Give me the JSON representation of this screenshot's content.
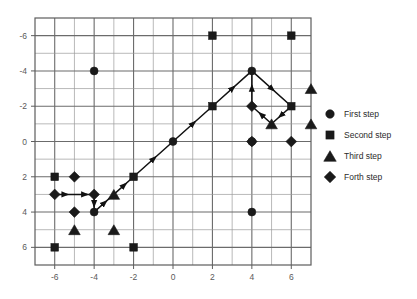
{
  "chart_data": {
    "type": "scatter",
    "title": "",
    "xlabel": "",
    "ylabel": "",
    "xlim": [
      -7,
      7
    ],
    "ylim": [
      -7,
      7
    ],
    "y_axis_inverted": true,
    "grid": true,
    "grid_step": 1,
    "xticks": [
      -6,
      -4,
      -2,
      0,
      2,
      4,
      6
    ],
    "xtick_labels": [
      "-6",
      "-4",
      "-2",
      "0",
      "2",
      "4",
      "6"
    ],
    "yticks": [
      -6,
      -4,
      -2,
      0,
      2,
      4,
      6
    ],
    "ytick_labels": [
      "-6",
      "-4",
      "-2",
      "0",
      "2",
      "4",
      "6"
    ],
    "legend_position": "right",
    "legend": [
      {
        "label": "First step",
        "marker": "circle"
      },
      {
        "label": "Second step",
        "marker": "square"
      },
      {
        "label": "Third step",
        "marker": "triangle"
      },
      {
        "label": "Forth step",
        "marker": "diamond"
      }
    ],
    "series": [
      {
        "name": "First step",
        "marker": "circle",
        "points": [
          {
            "x": -4,
            "y": -4
          },
          {
            "x": 4,
            "y": -4
          },
          {
            "x": 0,
            "y": 0
          },
          {
            "x": 4,
            "y": 0
          },
          {
            "x": 4,
            "y": 4
          },
          {
            "x": -4,
            "y": 4
          }
        ]
      },
      {
        "name": "Second step",
        "marker": "square",
        "points": [
          {
            "x": 2,
            "y": -6
          },
          {
            "x": 6,
            "y": -6
          },
          {
            "x": 2,
            "y": -2
          },
          {
            "x": 6,
            "y": -2
          },
          {
            "x": -6,
            "y": 2
          },
          {
            "x": -2,
            "y": 2
          },
          {
            "x": -6,
            "y": 6
          },
          {
            "x": -2,
            "y": 6
          }
        ]
      },
      {
        "name": "Third step",
        "marker": "triangle",
        "points": [
          {
            "x": 7,
            "y": -3
          },
          {
            "x": 5,
            "y": -1
          },
          {
            "x": 7,
            "y": -1
          },
          {
            "x": -3,
            "y": 3
          },
          {
            "x": -5,
            "y": 5
          },
          {
            "x": -3,
            "y": 5
          }
        ]
      },
      {
        "name": "Forth step",
        "marker": "diamond",
        "points": [
          {
            "x": 4,
            "y": -2
          },
          {
            "x": 4,
            "y": 0
          },
          {
            "x": 6,
            "y": 0
          },
          {
            "x": -5,
            "y": 2
          },
          {
            "x": -6,
            "y": 3
          },
          {
            "x": -4,
            "y": 3
          },
          {
            "x": -5,
            "y": 4
          }
        ]
      }
    ],
    "paths": [
      {
        "name": "main-diagonal-path",
        "arrows": true,
        "vertices": [
          {
            "x": -6,
            "y": 3
          },
          {
            "x": -5,
            "y": 3
          },
          {
            "x": -4,
            "y": 3
          },
          {
            "x": -4,
            "y": 4
          },
          {
            "x": -3,
            "y": 3
          },
          {
            "x": -2,
            "y": 2
          },
          {
            "x": 0,
            "y": 0
          },
          {
            "x": 2,
            "y": -2
          },
          {
            "x": 4,
            "y": -4
          }
        ]
      },
      {
        "name": "right-cycle-path",
        "arrows": true,
        "vertices": [
          {
            "x": 4,
            "y": -4
          },
          {
            "x": 6,
            "y": -2
          },
          {
            "x": 5,
            "y": -1
          },
          {
            "x": 4,
            "y": -2
          },
          {
            "x": 4,
            "y": -4
          }
        ]
      }
    ]
  }
}
